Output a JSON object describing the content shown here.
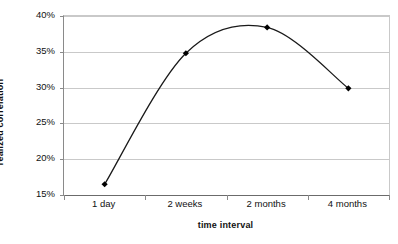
{
  "chart_data": {
    "type": "line",
    "title": "",
    "subtitle": "",
    "xlabel": "time interval",
    "ylabel": "realized correlation",
    "categories": [
      "1 day",
      "2 weeks",
      "2 months",
      "4 months"
    ],
    "values": [
      0.165,
      0.348,
      0.384,
      0.299
    ],
    "value_labels": [
      "16.5%",
      "34.8%",
      "38.4%",
      "29.9%"
    ],
    "series": [
      {
        "name": "realized correlation",
        "values": [
          0.165,
          0.348,
          0.384,
          0.299
        ]
      }
    ],
    "ylim": [
      0.15,
      0.4
    ],
    "ytick_values": [
      0.4,
      0.35,
      0.3,
      0.25,
      0.2,
      0.15
    ],
    "ytick_labels": [
      "40%",
      "35%",
      "30%",
      "25%",
      "20%",
      "15%"
    ],
    "xtick_labels": [
      "1 day",
      "2 weeks",
      "2 months",
      "4 months"
    ],
    "grid": "horizontal",
    "legend": "none",
    "smoothed": true,
    "marker": "diamond",
    "line_color": "#1a1a1a",
    "marker_color": "#000000",
    "grid_color": "#c9c9c9",
    "axis_color": "#6b6b6b",
    "background": "#ffffff",
    "annotations": []
  },
  "axes": {
    "y_title": "realized correlation",
    "x_title": "time interval"
  }
}
